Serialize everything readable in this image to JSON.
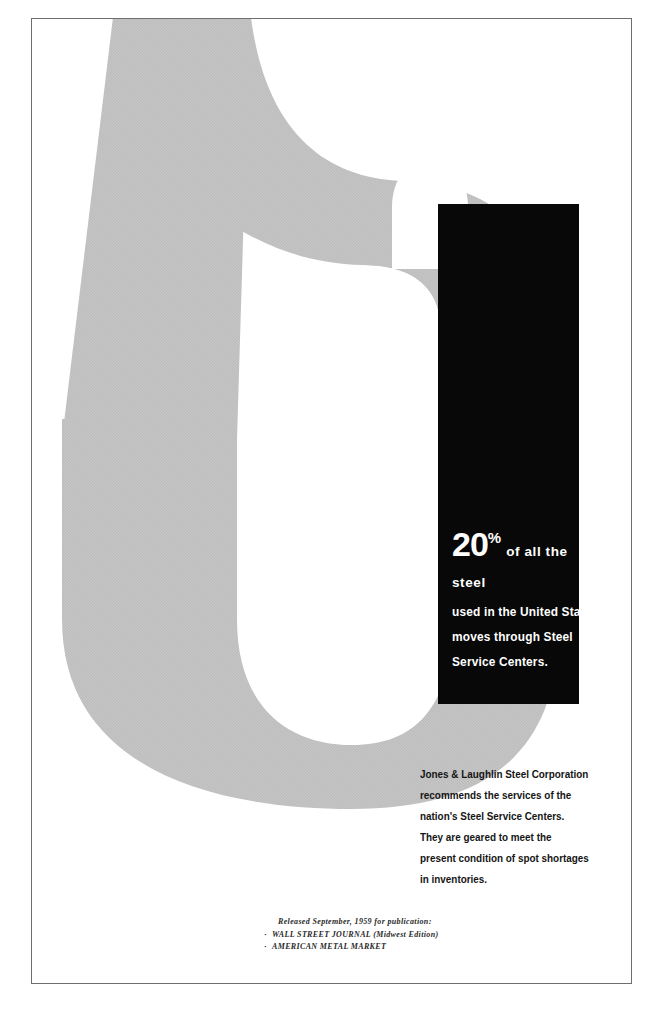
{
  "document": {
    "type": "print-advertisement",
    "advertiser": "Jones & Laughlin Steel Corporation"
  },
  "graphic": {
    "letterform": "S",
    "letterform_name": "steel-service-centers-s",
    "fill_color": "#c3c3c3",
    "panel_color": "#080808",
    "page_background": "#ffffff",
    "border_color": "#6e6e6e"
  },
  "headline": {
    "percent_number": "20",
    "percent_symbol": "%",
    "line1_tail": "of all the steel",
    "line2": "used in the United States",
    "line3": "moves through  Steel",
    "line4": "Service Centers.",
    "text_color": "#ffffff"
  },
  "body_copy": {
    "lines": [
      "Jones & Laughlin Steel Corporation",
      "recommends the services of the",
      "nation's Steel Service Centers.",
      "They are geared to meet the",
      "present condition of spot shortages",
      "in inventories."
    ],
    "text_color": "#151515"
  },
  "footer": {
    "release_note": "Released September, 1959 for publication:",
    "publications": [
      {
        "bullet": "·",
        "name": "WALL STREET JOURNAL (Midwest Edition)"
      },
      {
        "bullet": "·",
        "name": "AMERICAN METAL MARKET"
      }
    ]
  }
}
